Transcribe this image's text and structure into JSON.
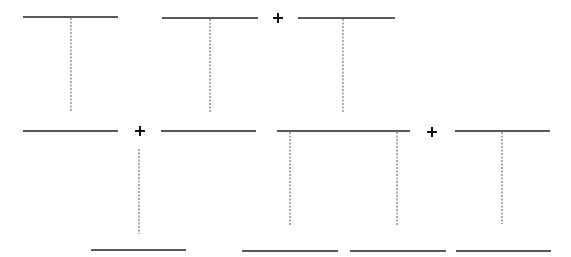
{
  "diagram": {
    "colors": {
      "line": "#222222",
      "dash": "#555555",
      "plus": "#111111",
      "background": "#ffffff"
    },
    "solid_lines": [
      {
        "x1": 23,
        "x2": 118,
        "y": 17
      },
      {
        "x1": 162,
        "x2": 258,
        "y": 18
      },
      {
        "x1": 298,
        "x2": 395,
        "y": 18
      },
      {
        "x1": 23,
        "x2": 118,
        "y": 131
      },
      {
        "x1": 161,
        "x2": 256,
        "y": 131
      },
      {
        "x1": 277,
        "x2": 410,
        "y": 131
      },
      {
        "x1": 455,
        "x2": 550,
        "y": 131
      },
      {
        "x1": 91,
        "x2": 186,
        "y": 250
      },
      {
        "x1": 242,
        "x2": 338,
        "y": 251
      },
      {
        "x1": 350,
        "x2": 446,
        "y": 251
      },
      {
        "x1": 456,
        "x2": 551,
        "y": 251
      }
    ],
    "dashed_lines": [
      {
        "x": 71,
        "y1": 18,
        "y2": 112
      },
      {
        "x": 210,
        "y1": 19,
        "y2": 112
      },
      {
        "x": 343,
        "y1": 19,
        "y2": 112
      },
      {
        "x": 139,
        "y1": 149,
        "y2": 234
      },
      {
        "x": 290,
        "y1": 132,
        "y2": 225
      },
      {
        "x": 397,
        "y1": 132,
        "y2": 225
      },
      {
        "x": 502,
        "y1": 132,
        "y2": 224
      }
    ],
    "plus_signs": [
      {
        "x": 278,
        "y": 18,
        "label": "+"
      },
      {
        "x": 140,
        "y": 131,
        "label": "+"
      },
      {
        "x": 432,
        "y": 132,
        "label": "+"
      }
    ]
  }
}
